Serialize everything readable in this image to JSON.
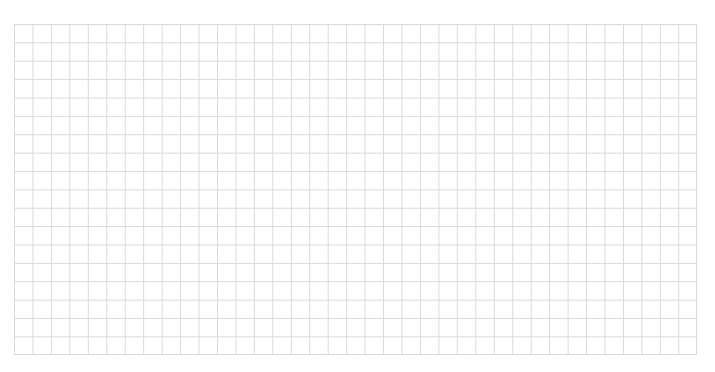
{
  "chart_data": {
    "type": "table",
    "title": "",
    "subtitle": "",
    "xlabel": "",
    "ylabel": "",
    "categories": [],
    "values": [],
    "series": [],
    "annotations": [],
    "legend": [],
    "grid": {
      "visible": true,
      "columns": 37,
      "rows": 18,
      "cell_width_px": 18.46,
      "cell_height_px": 18.39,
      "line_color": "#d9d9d9",
      "line_width_px": 1,
      "cell_fill": "#ffffff",
      "major_minor_distinction": false
    },
    "plot_area": {
      "left_px": 14,
      "top_px": 24,
      "width_px": 683,
      "height_px": 331
    },
    "axes": {
      "visible": false,
      "tick_labels_x": [],
      "tick_labels_y": []
    }
  },
  "canvas": {
    "width_px": 715,
    "height_px": 372,
    "background_color": "#ffffff"
  }
}
